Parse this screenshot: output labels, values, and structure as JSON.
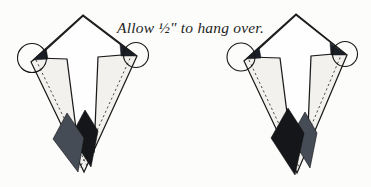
{
  "caption": {
    "text": "Allow ½\" to hang over."
  },
  "colors": {
    "background": "#fcfcfa",
    "kite_fill": "#f2f1ee",
    "arrow_fill": "#fefefe",
    "outline": "#1a1a1a",
    "slate_patch": "#454c56",
    "black_patch": "#15161a",
    "overhang_dark": "#1a1e26"
  },
  "figures": [
    {
      "name": "left-kite-diagram",
      "front_patch_color": "slate",
      "back_patch_color": "black"
    },
    {
      "name": "right-kite-diagram",
      "front_patch_color": "black",
      "back_patch_color": "slate"
    }
  ]
}
